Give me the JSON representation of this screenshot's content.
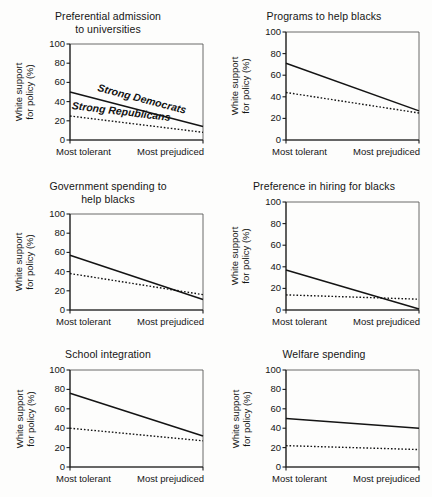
{
  "figure": {
    "axis": {
      "y_label_line1": "White support",
      "y_label_line2": "for policy (%)",
      "y_ticks": [
        "100",
        "80",
        "60",
        "40",
        "20",
        "0"
      ],
      "x_tick_left": "Most tolerant",
      "x_tick_right": "Most prejudiced"
    },
    "series_labels": {
      "democrats": "Strong Democrats",
      "republicans": "Strong Republicans"
    }
  },
  "chart_data": [
    {
      "type": "line",
      "title": "Preferential admission to universities",
      "title_line1": "Preferential admission",
      "title_line2": "to universities",
      "xlabel": "",
      "ylabel": "White support for policy (%)",
      "ylim": [
        0,
        100
      ],
      "x": [
        "Most tolerant",
        "Most prejudiced"
      ],
      "grid": false,
      "legend": "inline-annotation",
      "series": [
        {
          "name": "Strong Democrats",
          "style": "solid",
          "values": [
            50,
            14
          ]
        },
        {
          "name": "Strong Republicans",
          "style": "dotted",
          "values": [
            25,
            8
          ]
        }
      ]
    },
    {
      "type": "line",
      "title": "Programs to help blacks",
      "title_line1": "Programs to help blacks",
      "title_line2": "",
      "xlabel": "",
      "ylabel": "White support for policy (%)",
      "ylim": [
        0,
        100
      ],
      "x": [
        "Most tolerant",
        "Most prejudiced"
      ],
      "grid": false,
      "legend": "none",
      "series": [
        {
          "name": "Strong Democrats",
          "style": "solid",
          "values": [
            71,
            27
          ]
        },
        {
          "name": "Strong Republicans",
          "style": "dotted",
          "values": [
            44,
            25
          ]
        }
      ]
    },
    {
      "type": "line",
      "title": "Government spending to help blacks",
      "title_line1": "Government spending to",
      "title_line2": "help blacks",
      "xlabel": "",
      "ylabel": "White support for policy (%)",
      "ylim": [
        0,
        100
      ],
      "x": [
        "Most tolerant",
        "Most prejudiced"
      ],
      "grid": false,
      "legend": "none",
      "series": [
        {
          "name": "Strong Democrats",
          "style": "solid",
          "values": [
            57,
            11
          ]
        },
        {
          "name": "Strong Republicans",
          "style": "dotted",
          "values": [
            38,
            16
          ]
        }
      ]
    },
    {
      "type": "line",
      "title": "Preference in hiring for blacks",
      "title_line1": "Preference in hiring for blacks",
      "title_line2": "",
      "xlabel": "",
      "ylabel": "White support for policy (%)",
      "ylim": [
        0,
        100
      ],
      "x": [
        "Most tolerant",
        "Most prejudiced"
      ],
      "grid": false,
      "legend": "none",
      "series": [
        {
          "name": "Strong Democrats",
          "style": "solid",
          "values": [
            37,
            1
          ]
        },
        {
          "name": "Strong Republicans",
          "style": "dotted",
          "values": [
            14,
            10
          ]
        }
      ]
    },
    {
      "type": "line",
      "title": "School integration",
      "title_line1": "School integration",
      "title_line2": "",
      "xlabel": "",
      "ylabel": "White support for policy (%)",
      "ylim": [
        0,
        100
      ],
      "x": [
        "Most tolerant",
        "Most prejudiced"
      ],
      "grid": false,
      "legend": "none",
      "series": [
        {
          "name": "Strong Democrats",
          "style": "solid",
          "values": [
            76,
            32
          ]
        },
        {
          "name": "Strong Republicans",
          "style": "dotted",
          "values": [
            40,
            27
          ]
        }
      ]
    },
    {
      "type": "line",
      "title": "Welfare spending",
      "title_line1": "Welfare spending",
      "title_line2": "",
      "xlabel": "",
      "ylabel": "White support for policy (%)",
      "ylim": [
        0,
        100
      ],
      "x": [
        "Most tolerant",
        "Most prejudiced"
      ],
      "grid": false,
      "legend": "none",
      "series": [
        {
          "name": "Strong Democrats",
          "style": "solid",
          "values": [
            50,
            40
          ]
        },
        {
          "name": "Strong Republicans",
          "style": "dotted",
          "values": [
            22,
            18
          ]
        }
      ]
    }
  ]
}
